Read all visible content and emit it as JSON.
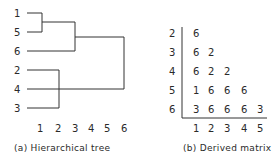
{
  "tree": {
    "caption": "(a) Hierarchical tree",
    "leaves": [
      "1",
      "5",
      "6",
      "2",
      "4",
      "3"
    ],
    "axis_ticks": [
      "1",
      "2",
      "3",
      "4",
      "5",
      "6"
    ],
    "merges": [
      {
        "items": [
          "1",
          "5"
        ],
        "level": 1
      },
      {
        "items": [
          "1-5",
          "6"
        ],
        "level": 3
      },
      {
        "items": [
          "2",
          "3"
        ],
        "level": 2
      },
      {
        "items": [
          "2-3",
          "4"
        ],
        "level": 2
      },
      {
        "items": [
          "1-5-6",
          "2-3-4"
        ],
        "level": 6
      }
    ]
  },
  "matrix": {
    "caption": "(b) Derived matrix",
    "row_labels": [
      "2",
      "3",
      "4",
      "5",
      "6"
    ],
    "col_labels": [
      "1",
      "2",
      "3",
      "4",
      "5"
    ],
    "rows": [
      [
        "6"
      ],
      [
        "6",
        "2"
      ],
      [
        "6",
        "2",
        "2"
      ],
      [
        "1",
        "6",
        "6",
        "6"
      ],
      [
        "3",
        "6",
        "6",
        "6",
        "3"
      ]
    ]
  }
}
